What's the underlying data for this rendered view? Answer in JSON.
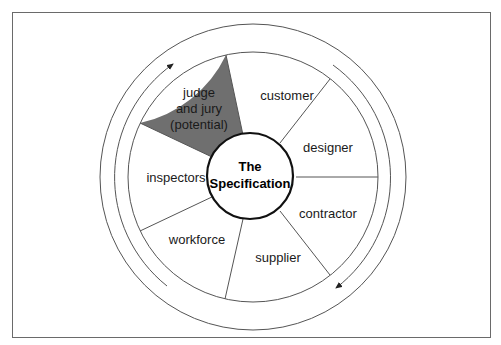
{
  "diagram": {
    "center": {
      "line1": "The",
      "line2": "Specification"
    },
    "segments": [
      {
        "label": "customer",
        "shaded": false
      },
      {
        "label": "designer",
        "shaded": false
      },
      {
        "label": "contractor",
        "shaded": false
      },
      {
        "label": "supplier",
        "shaded": false
      },
      {
        "label": "workforce",
        "shaded": false
      },
      {
        "label": "inspectors",
        "shaded": false
      },
      {
        "label_lines": [
          "judge",
          "and jury",
          "(potential)"
        ],
        "shaded": true
      }
    ],
    "arrows": {
      "direction": "clockwise"
    },
    "colors": {
      "shaded": "#6f6f6f",
      "line": "#555555",
      "center_border": "#111111"
    }
  }
}
